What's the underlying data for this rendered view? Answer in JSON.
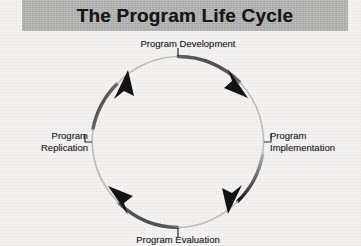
{
  "title": {
    "text": "The Program Life Cycle"
  },
  "colors": {
    "page_background": "#f3f2f0",
    "title_band": "#b3b3b2",
    "title_text": "#17171a",
    "arc_dark": "#16161a",
    "arc_light": "#a9a9a9",
    "label_text": "#2a2a2d",
    "leader_line": "#2a2a2d"
  },
  "diagram": {
    "type": "cycle",
    "direction": "clockwise",
    "center_x": 178,
    "center_y": 142,
    "radius": 86,
    "stage_count": 4,
    "stages": [
      {
        "id": "program-development",
        "label": "Program Development",
        "position": "top",
        "angle_deg": 270
      },
      {
        "id": "program-implementation",
        "label": "Program\nImplementation",
        "position": "right",
        "angle_deg": 0
      },
      {
        "id": "program-evaluation",
        "label": "Program Evaluation",
        "position": "bottom",
        "angle_deg": 90
      },
      {
        "id": "program-replication",
        "label": "Program\nReplication",
        "position": "left",
        "angle_deg": 180
      }
    ],
    "arrowheads": [
      {
        "id": "arrow-ne",
        "quadrant": "north-east",
        "angle_deg": 315
      },
      {
        "id": "arrow-se",
        "quadrant": "south-east",
        "angle_deg": 45
      },
      {
        "id": "arrow-sw",
        "quadrant": "south-west",
        "angle_deg": 135
      },
      {
        "id": "arrow-nw",
        "quadrant": "north-west",
        "angle_deg": 225
      }
    ]
  }
}
